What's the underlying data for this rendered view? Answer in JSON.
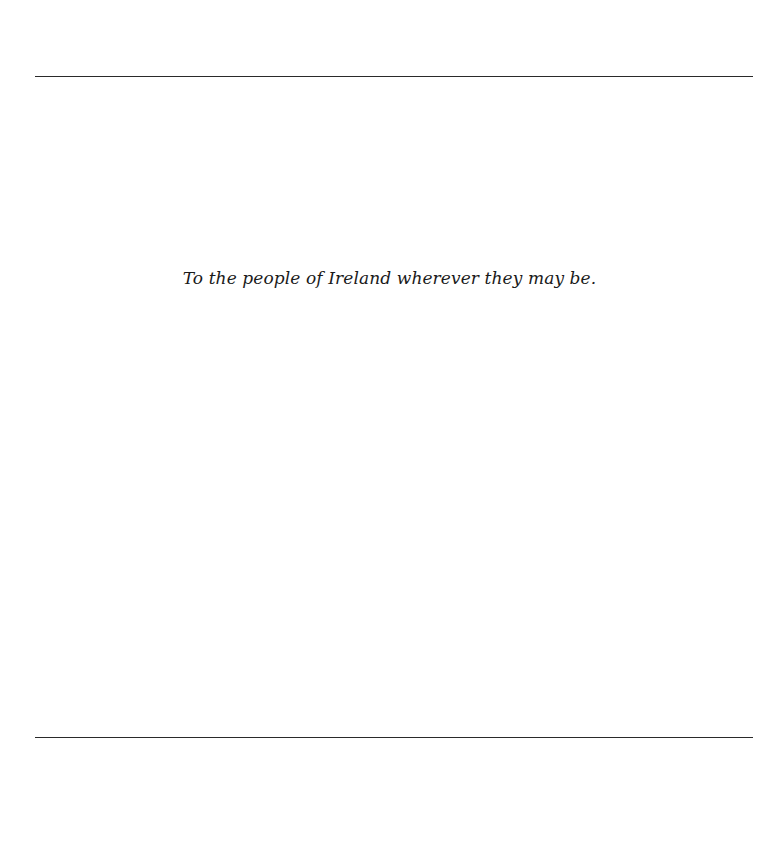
{
  "page": {
    "dedication": "To the people of Ireland wherever they may be."
  }
}
